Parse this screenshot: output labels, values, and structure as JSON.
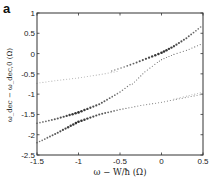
{
  "panel_label": "a",
  "chart_data": {
    "type": "scatter",
    "title": "",
    "xlabel": "ω − W/ħ (Ω)",
    "ylabel": "ω_dec − ω_dec,0 (Ω)",
    "xlim": [
      -1.5,
      0.5
    ],
    "ylim": [
      -2.5,
      1
    ],
    "xticks": [
      -1.5,
      -1,
      -0.5,
      0,
      0.5
    ],
    "xtick_labels": [
      "-1.5",
      "-1",
      "-0.5",
      "0",
      "0.5"
    ],
    "yticks": [
      1,
      0.5,
      0,
      -0.5,
      -1,
      -1.5,
      -2,
      -2.5
    ],
    "ytick_labels": [
      "1",
      "0.5",
      "0",
      "-0.5",
      "-1",
      "-1.5",
      "-2",
      "-2.5"
    ],
    "grid": false,
    "legend": null,
    "series": [
      {
        "name": "branch-upper-left-faint",
        "x": [
          -1.5,
          -1.25,
          -1.0,
          -0.75,
          -0.5
        ],
        "y": [
          -0.73,
          -0.66,
          -0.6,
          -0.52,
          -0.43
        ],
        "weight": "faint"
      },
      {
        "name": "branch-upper",
        "x": [
          -0.6,
          -0.45,
          -0.3,
          -0.15,
          0.0,
          0.15,
          0.3,
          0.5
        ],
        "y": [
          -0.43,
          -0.33,
          -0.22,
          -0.1,
          0.02,
          0.18,
          0.38,
          0.7
        ],
        "weight": "strong-near-0"
      },
      {
        "name": "branch-upper-inner",
        "x": [
          -0.35,
          -0.2,
          -0.05,
          0.0,
          0.15,
          0.3,
          0.5
        ],
        "y": [
          -0.75,
          -0.45,
          -0.22,
          -0.15,
          -0.02,
          0.08,
          0.25
        ],
        "weight": "medium"
      },
      {
        "name": "branch-right-faint",
        "x": [
          0.15,
          0.3,
          0.5
        ],
        "y": [
          -1.12,
          -1.05,
          -0.95
        ],
        "weight": "faint"
      },
      {
        "name": "branch-lower-upper",
        "x": [
          -1.5,
          -1.25,
          -1.0,
          -0.75,
          -0.5,
          -0.35
        ],
        "y": [
          -1.72,
          -1.6,
          -1.45,
          -1.25,
          -0.95,
          -0.72
        ],
        "weight": "strong-near-minus1"
      },
      {
        "name": "branch-lower-lower",
        "x": [
          -1.5,
          -1.25,
          -1.0,
          -0.75,
          -0.5,
          -0.25,
          0.0,
          0.25,
          0.5
        ],
        "y": [
          -2.2,
          -1.95,
          -1.68,
          -1.5,
          -1.38,
          -1.28,
          -1.2,
          -1.1,
          -1.0
        ],
        "weight": "strong-near-minus1"
      }
    ]
  }
}
